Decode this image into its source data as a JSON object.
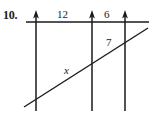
{
  "figure": {
    "problem_number": "10.",
    "type": "geometry-diagram",
    "stroke_color": "#1a1a1a",
    "background_color": "#ffffff",
    "labels": {
      "segment_top_left": "12",
      "segment_top_right": "6",
      "segment_slant_right": "7",
      "segment_slant_left": "x"
    },
    "geometry": {
      "horizontal_line": {
        "x1": 26,
        "y1": 22,
        "x2": 149,
        "y2": 22
      },
      "slant_line": {
        "x1": 24,
        "y1": 107,
        "x2": 148,
        "y2": 28
      },
      "vertical_lines": [
        {
          "x": 36,
          "y_top": 11,
          "y_bottom": 111,
          "arrow": "up"
        },
        {
          "x": 92,
          "y_top": 11,
          "y_bottom": 111,
          "arrow": "up"
        },
        {
          "x": 125,
          "y_top": 11,
          "y_bottom": 111,
          "arrow": "up"
        }
      ]
    }
  }
}
